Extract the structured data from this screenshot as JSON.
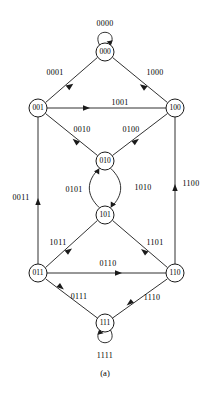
{
  "figure": {
    "caption": "(a)",
    "type": "state-transition-diagram"
  },
  "nodes": [
    {
      "id": "000",
      "label": "000",
      "cx": 105,
      "cy": 52,
      "r": 9
    },
    {
      "id": "001",
      "label": "001",
      "cx": 38,
      "cy": 108,
      "r": 9
    },
    {
      "id": "100",
      "label": "100",
      "cx": 175,
      "cy": 108,
      "r": 9
    },
    {
      "id": "010",
      "label": "010",
      "cx": 105,
      "cy": 161,
      "r": 9
    },
    {
      "id": "101",
      "label": "101",
      "cx": 105,
      "cy": 215,
      "r": 9
    },
    {
      "id": "011",
      "label": "011",
      "cx": 38,
      "cy": 273,
      "r": 9
    },
    {
      "id": "110",
      "label": "110",
      "cx": 175,
      "cy": 273,
      "r": 9
    },
    {
      "id": "111",
      "label": "111",
      "cx": 105,
      "cy": 323,
      "r": 9
    }
  ],
  "edges": [
    {
      "id": "e-0000",
      "from": "000",
      "to": "000",
      "label": "0000",
      "kind": "self-loop-top",
      "label_x": 105,
      "label_y": 24
    },
    {
      "id": "e-0001",
      "from": "000",
      "to": "001",
      "label": "0001",
      "kind": "straight",
      "label_x": 55,
      "label_y": 73
    },
    {
      "id": "e-1000",
      "from": "000",
      "to": "100",
      "label": "1000",
      "kind": "straight",
      "label_x": 155,
      "label_y": 73
    },
    {
      "id": "e-1001",
      "from": "001",
      "to": "100",
      "label": "1001",
      "kind": "straight",
      "label_x": 120,
      "label_y": 103
    },
    {
      "id": "e-0010",
      "from": "001",
      "to": "010",
      "label": "0010",
      "kind": "straight",
      "label_x": 82,
      "label_y": 130
    },
    {
      "id": "e-0100",
      "from": "100",
      "to": "010",
      "label": "0100",
      "kind": "straight",
      "label_x": 131,
      "label_y": 130
    },
    {
      "id": "e-0101",
      "from": "101",
      "to": "010",
      "label": "0101",
      "kind": "curve-left",
      "label_x": 74,
      "label_y": 190
    },
    {
      "id": "e-1010",
      "from": "010",
      "to": "101",
      "label": "1010",
      "kind": "curve-right",
      "label_x": 143,
      "label_y": 188
    },
    {
      "id": "e-0011",
      "from": "011",
      "to": "001",
      "label": "0011",
      "kind": "vertical-up",
      "label_x": 21,
      "label_y": 198
    },
    {
      "id": "e-1100",
      "from": "110",
      "to": "100",
      "label": "1100",
      "kind": "vertical-up",
      "label_x": 191,
      "label_y": 184
    },
    {
      "id": "e-1011",
      "from": "101",
      "to": "011",
      "label": "1011",
      "kind": "straight",
      "label_x": 58,
      "label_y": 243
    },
    {
      "id": "e-1101",
      "from": "101",
      "to": "110",
      "label": "1101",
      "kind": "straight",
      "label_x": 155,
      "label_y": 243
    },
    {
      "id": "e-0110",
      "from": "011",
      "to": "110",
      "label": "0110",
      "kind": "straight",
      "label_x": 108,
      "label_y": 264
    },
    {
      "id": "e-0111",
      "from": "111",
      "to": "011",
      "label": "0111",
      "kind": "straight",
      "label_x": 79,
      "label_y": 297
    },
    {
      "id": "e-1110",
      "from": "111",
      "to": "110",
      "label": "1110",
      "kind": "straight",
      "label_x": 152,
      "label_y": 298
    },
    {
      "id": "e-1111",
      "from": "111",
      "to": "111",
      "label": "1111",
      "kind": "self-loop-bottom",
      "label_x": 105,
      "label_y": 356
    }
  ],
  "colors": {
    "stroke": "#1a1a1a",
    "background": "#ffffff",
    "text": "#000000"
  }
}
